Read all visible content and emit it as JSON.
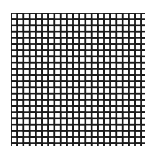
{
  "image": {
    "subject": "herringbone-brick-pattern",
    "background_color": "#ffffff",
    "stroke_color": "#1a1a1a",
    "pattern": {
      "type": "herringbone",
      "brick_length_units": 2,
      "brick_width_units": 1,
      "unit_px": 6.2,
      "bounds": {
        "x": 11,
        "y": 13,
        "width": 134,
        "height": 133
      }
    }
  }
}
